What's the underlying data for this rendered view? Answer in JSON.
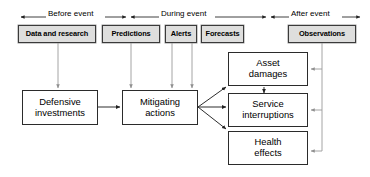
{
  "diagram": {
    "colors": {
      "shaded_fill": "#dededd",
      "box_stroke": "#2b2b2b",
      "connector_gray": "#9a9a9a",
      "connector_black": "#222222",
      "background": "#ffffff"
    },
    "phases": [
      {
        "id": "before",
        "label": "Before event"
      },
      {
        "id": "during",
        "label": "During event"
      },
      {
        "id": "after",
        "label": "After event"
      }
    ],
    "inputs": [
      {
        "id": "data-and-research",
        "label": "Data and research",
        "phase": "before"
      },
      {
        "id": "predictions",
        "label": "Predictions",
        "phase": "during"
      },
      {
        "id": "alerts",
        "label": "Alerts",
        "phase": "during"
      },
      {
        "id": "forecasts",
        "label": "Forecasts",
        "phase": "during"
      },
      {
        "id": "observations",
        "label": "Observations",
        "phase": "after"
      }
    ],
    "actions": [
      {
        "id": "defensive-investments",
        "line1": "Defensive",
        "line2": "investments"
      },
      {
        "id": "mitigating-actions",
        "line1": "Mitigating",
        "line2": "actions"
      }
    ],
    "impacts": [
      {
        "id": "asset-damages",
        "line1": "Asset",
        "line2": "damages"
      },
      {
        "id": "service-interruptions",
        "line1": "Service",
        "line2": "interruptions"
      },
      {
        "id": "health-effects",
        "line1": "Health",
        "line2": "effects"
      }
    ]
  }
}
